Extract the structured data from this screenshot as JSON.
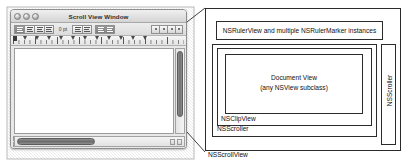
{
  "window": {
    "title": "Scroll View Window",
    "traffic_lights": [
      "close-button",
      "minimize-button",
      "zoom-button"
    ],
    "toolbar": {
      "alignment_buttons": [
        {
          "name": "align-left-button",
          "state": "on"
        },
        {
          "name": "align-center-button",
          "state": "off"
        },
        {
          "name": "align-right-button",
          "state": "off"
        },
        {
          "name": "align-justify-button",
          "state": "off"
        }
      ],
      "spacing_value": "0 pt",
      "tab_buttons": [
        {
          "name": "tab-stop-button-1"
        },
        {
          "name": "tab-stop-button-2"
        }
      ],
      "list_buttons": [
        {
          "name": "line-spacing-button",
          "state": "on"
        },
        {
          "name": "paragraph-spacing-button",
          "state": "on"
        }
      ],
      "ruler_option_buttons": [
        {
          "name": "ruler-dot-button-1"
        },
        {
          "name": "ruler-dot-button-2"
        },
        {
          "name": "ruler-dot-button-3"
        },
        {
          "name": "ruler-dot-button-4"
        }
      ]
    },
    "ruler": {
      "tab_marker_count": 13,
      "left_indent_marker": "left-indent-marker"
    },
    "scrollers": {
      "vertical": {
        "thumb": "vertical-scroll-thumb",
        "arrows": 2
      },
      "horizontal": {
        "thumb": "horizontal-scroll-thumb",
        "arrows": 2
      }
    }
  },
  "diagram": {
    "scrollview_label": "NSScrollView",
    "ruler_label": "NSRulerView and multiple NSRulerMarker instances",
    "horizontal_scroller_label": "NSScroller",
    "clipview_label": "NSClipView",
    "document_view_label_line1": "Document View",
    "document_view_label_line2": "(any NSView subclass)",
    "vertical_scroller_label": "NSScroller"
  },
  "colors": {
    "stroke": "#2b2b2b",
    "window_chrome": "#e8e8e8",
    "canvas": "#ffffff",
    "scroll_thumb": "#7a7a7a"
  }
}
